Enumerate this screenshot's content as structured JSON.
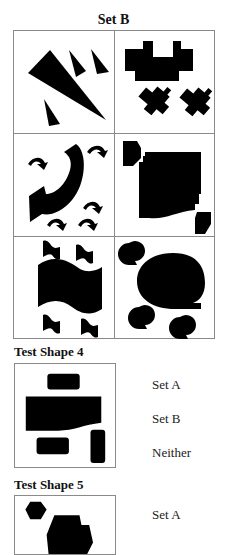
{
  "set_title": "Set B",
  "grid": {
    "rows": 3,
    "cols": 2,
    "cells": [
      {
        "name": "triangles",
        "description": "one large and three small black triangles"
      },
      {
        "name": "blocky-crosses",
        "description": "one large pixel-stepped block and two small rotated stepped blocks"
      },
      {
        "name": "curved-arrows",
        "description": "one large curved arrow and five small curved arrows"
      },
      {
        "name": "stepped-squares",
        "description": "one large stepped square with wavy bottom and two small corner squares"
      },
      {
        "name": "wavy-flags",
        "description": "one large wavy flag and four small wavy flags"
      },
      {
        "name": "speech-bubbles",
        "description": "one large rounded bubble and three small bubbles"
      }
    ]
  },
  "test_shapes": [
    {
      "label": "Test Shape 4",
      "options": [
        "Set A",
        "Set B",
        "Neither"
      ]
    },
    {
      "label": "Test Shape 5",
      "options": [
        "Set A"
      ]
    }
  ],
  "colors": {
    "border": "#8a8a8a",
    "shape_fill": "#000000",
    "text": "#111111"
  }
}
